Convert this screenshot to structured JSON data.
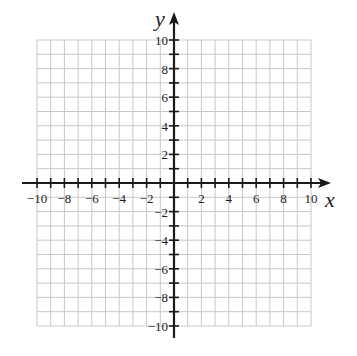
{
  "chart_data": {
    "type": "coordinate-grid",
    "title": "",
    "xlabel": "x",
    "ylabel": "y",
    "xlim": [
      -10,
      10
    ],
    "ylim": [
      -10,
      10
    ],
    "grid": true,
    "grid_step": 1,
    "x_tick_labels": [
      "-10",
      "-8",
      "-6",
      "-4",
      "-2",
      "2",
      "4",
      "6",
      "8",
      "10"
    ],
    "y_tick_labels": [
      "10",
      "8",
      "6",
      "4",
      "2",
      "-2",
      "-4",
      "-6",
      "-8",
      "-10"
    ],
    "series": []
  },
  "colors": {
    "grid": "#c8c8c8",
    "axis": "#1a1a1a",
    "text": "#222222"
  }
}
